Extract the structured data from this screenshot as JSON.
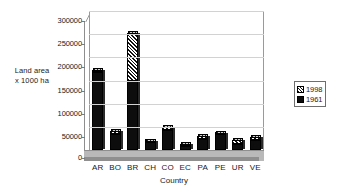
{
  "chart_data": {
    "type": "bar",
    "subtype": "stacked-column-3d",
    "title": "",
    "xlabel": "Country",
    "ylabel": "Land area x 1000 ha",
    "ylabel_lines": [
      "Land area",
      "x 1000 ha"
    ],
    "categories": [
      "AR",
      "BO",
      "BR",
      "CH",
      "CO",
      "EC",
      "PA",
      "PE",
      "UR",
      "VE"
    ],
    "series": [
      {
        "name": "1961",
        "pattern": "solid-black",
        "color": "#0d0d0d",
        "values": [
          168000,
          34000,
          150000,
          18000,
          44000,
          8000,
          24000,
          34000,
          14000,
          22000
        ]
      },
      {
        "name": "1998",
        "pattern": "diagonal-hatch",
        "color": "#111111",
        "values": [
          172000,
          40000,
          252000,
          20000,
          49000,
          13000,
          30000,
          37000,
          21000,
          28000
        ]
      }
    ],
    "stacking_note": "Each column shows the 1961 value as a solid black base with the additional 1998 amount drawn as a hatched cap reaching the 1998 total.",
    "ylim": [
      0,
      300000
    ],
    "yticks": [
      0,
      50000,
      100000,
      150000,
      200000,
      250000,
      300000
    ],
    "ytick_labels": [
      "0",
      "50000",
      "100000",
      "150000",
      "200000",
      "250000",
      "300000"
    ],
    "grid": true,
    "grid_axis": "y",
    "legend_position": "right",
    "legend_entries": [
      "1998",
      "1961"
    ]
  },
  "legend": {
    "entries": [
      {
        "label": "1998",
        "swatch": "hatch"
      },
      {
        "label": "1961",
        "swatch": "solid"
      }
    ]
  }
}
